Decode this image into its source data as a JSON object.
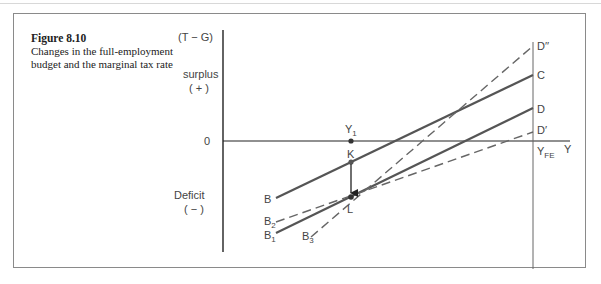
{
  "figure": {
    "number": "Figure 8.10",
    "caption_line1": "Changes in the full-employment",
    "caption_line2": "budget and the marginal tax rate"
  },
  "axes": {
    "y_label": "(T − G)",
    "surplus_label": "surplus",
    "surplus_sign": "( + )",
    "deficit_label": "Deficit",
    "deficit_sign": "( − )",
    "zero_label": "0",
    "x_label": "Y",
    "y1_label": "Y",
    "y1_sub": "1",
    "yfe_label": "Y",
    "yfe_sub": "FE"
  },
  "points": {
    "K": "K",
    "L": "L"
  },
  "lines": {
    "BC": {
      "start": "B",
      "end": "C",
      "style": "solid"
    },
    "B1D": {
      "start": "B",
      "start_sub": "1",
      "end": "D",
      "style": "solid"
    },
    "B2Dp": {
      "start": "B",
      "start_sub": "2",
      "end": "D′",
      "style": "dashed"
    },
    "B3Dpp": {
      "start": "B",
      "start_sub": "3",
      "end": "D′′",
      "style": "dashed"
    }
  },
  "colors": {
    "line": "#555555",
    "axis": "#222222",
    "frame": "#8a8a8a"
  }
}
